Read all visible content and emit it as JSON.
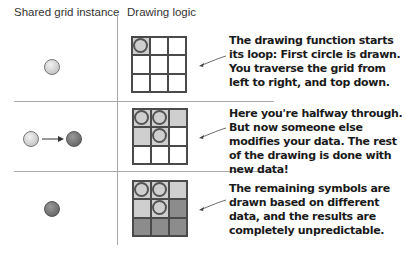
{
  "headers": {
    "left": "Shared grid instance",
    "right": "Drawing logic"
  },
  "rows": [
    {
      "state": "light",
      "transition": false,
      "grid": [
        [
          "light-ring",
          "empty",
          "empty"
        ],
        [
          "empty",
          "empty",
          "empty"
        ],
        [
          "empty",
          "empty",
          "empty"
        ]
      ],
      "callout": "The drawing function starts its loop: First circle is drawn. You traverse the grid from left to right, and top down."
    },
    {
      "state": "light-to-dark",
      "transition": true,
      "grid": [
        [
          "light-ring",
          "light-ring",
          "light"
        ],
        [
          "light",
          "light-ring",
          "empty"
        ],
        [
          "empty",
          "empty",
          "empty"
        ]
      ],
      "callout": "Here you're halfway through. But now someone else modifies your data. The rest of the drawing is done with new data!"
    },
    {
      "state": "dark",
      "transition": false,
      "grid": [
        [
          "light-ring",
          "light-ring",
          "light"
        ],
        [
          "light",
          "light-ring",
          "dark"
        ],
        [
          "dark",
          "dark",
          "dark"
        ]
      ],
      "callout": "The remaining symbols are drawn based on different data, and the results are completely unpredictable."
    }
  ],
  "colors": {
    "line": "#a8a8a8",
    "cell_light": "#cfcfcf",
    "cell_dark": "#8c8c8c",
    "ring": "#555555"
  }
}
